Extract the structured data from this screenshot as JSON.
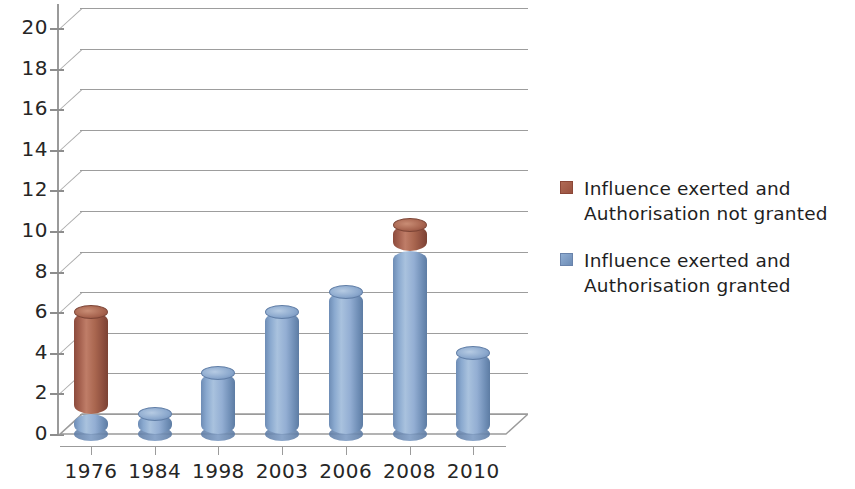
{
  "chart_data": {
    "type": "bar",
    "subtype": "stacked-3d-cylinder",
    "title": "",
    "xlabel": "",
    "ylabel": "",
    "categories": [
      "1976",
      "1984",
      "1998",
      "2003",
      "2006",
      "2008",
      "2010"
    ],
    "series": [
      {
        "name": "Influence exerted and Authorisation granted",
        "color": "#7d9cc4",
        "values": [
          1,
          1,
          3,
          6,
          7,
          9,
          4
        ]
      },
      {
        "name": "Influence exerted and Authorisation not granted",
        "color": "#9c5444",
        "values": [
          5,
          0,
          0,
          0,
          0,
          1.3,
          0
        ]
      }
    ],
    "totals": [
      6,
      1,
      3,
      6,
      7,
      10.3,
      4
    ],
    "ylim": [
      0,
      21
    ],
    "ytick_step": 2,
    "ytick_labels": [
      "0",
      "2",
      "4",
      "6",
      "8",
      "10",
      "12",
      "14",
      "16",
      "18",
      "20"
    ],
    "grid": true,
    "grid_axis": "y",
    "legend_position": "right",
    "stack_order_bottom_to_top": [
      "Influence exerted and Authorisation granted",
      "Influence exerted and Authorisation not granted"
    ]
  },
  "axes": {
    "y": {
      "ticks": [
        "20",
        "18",
        "16",
        "14",
        "12",
        "10",
        "8",
        "6",
        "4",
        "2",
        "0"
      ]
    },
    "x": {
      "ticks": [
        "1976",
        "1984",
        "1998",
        "2003",
        "2006",
        "2008",
        "2010"
      ]
    }
  },
  "legend": {
    "entries": [
      {
        "swatch": "red",
        "line1": "Influence exerted and",
        "line2": "Authorisation not granted"
      },
      {
        "swatch": "blue",
        "line1": "Influence exerted and",
        "line2": "Authorisation granted"
      }
    ]
  },
  "colors": {
    "series_granted": "#7d9cc4",
    "series_not_granted": "#9c5444",
    "gridline": "#8c8c8c",
    "axis": "#8d8d8d",
    "text": "#262626",
    "background": "#ffffff"
  }
}
